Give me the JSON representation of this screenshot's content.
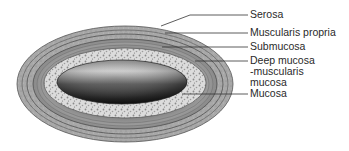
{
  "diagram": {
    "type": "cross-section",
    "labels": [
      {
        "id": "serosa",
        "text": "Serosa",
        "y": 10
      },
      {
        "id": "muscularis-propria",
        "text": "Muscularis propria",
        "y": 28
      },
      {
        "id": "submucosa",
        "text": "Submucosa",
        "y": 42
      },
      {
        "id": "deep-mucosa",
        "text": "Deep mucosa",
        "y": 55
      },
      {
        "id": "deep-mucosa-2",
        "text": "-muscularis",
        "y": 66
      },
      {
        "id": "deep-mucosa-3",
        "text": "mucosa",
        "y": 77
      },
      {
        "id": "mucosa",
        "text": "Mucosa",
        "y": 88
      }
    ],
    "colors": {
      "serosa": "#9a9a9a",
      "muscularis": "#8c8c8c",
      "submucosa": "#d6d6d6",
      "lumen_dark": "#2b2b2b",
      "lumen_light": "#bdbdbd",
      "line": "#333333"
    }
  }
}
